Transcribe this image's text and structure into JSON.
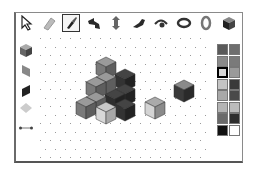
{
  "toolbar": {
    "tools": [
      {
        "name": "pointer",
        "icon": "pointer-arrow-icon",
        "x": 18,
        "selected": false
      },
      {
        "name": "eraser",
        "icon": "eraser-icon",
        "x": 40,
        "selected": false
      },
      {
        "name": "paint",
        "icon": "paint-brush-icon",
        "x": 62,
        "selected": true
      },
      {
        "name": "rotate-horizontal",
        "icon": "rotate-arrow-icon",
        "x": 85,
        "selected": false
      },
      {
        "name": "rotate-vertical",
        "icon": "vertical-arrow-icon",
        "x": 107,
        "selected": false
      },
      {
        "name": "rotate-curve",
        "icon": "curved-arrow-icon",
        "x": 130,
        "selected": false
      },
      {
        "name": "view",
        "icon": "eye-icon",
        "x": 152,
        "selected": false
      },
      {
        "name": "orbit-horizontal",
        "icon": "ring-horizontal-icon",
        "x": 175,
        "selected": false
      },
      {
        "name": "orbit-vertical",
        "icon": "ring-vertical-icon",
        "x": 197,
        "selected": false
      },
      {
        "name": "cube-view",
        "icon": "cube-icon",
        "x": 220,
        "selected": false
      }
    ]
  },
  "side_tools": [
    {
      "name": "cube",
      "icon": "cube-shape-icon",
      "y": 42
    },
    {
      "name": "left-face",
      "icon": "left-face-icon",
      "y": 62
    },
    {
      "name": "right-face",
      "icon": "right-face-icon",
      "y": 82
    },
    {
      "name": "top-face",
      "icon": "top-face-diamond-icon",
      "y": 100
    },
    {
      "name": "line",
      "icon": "line-segment-icon",
      "y": 120
    }
  ],
  "palette": {
    "selected_index": 4,
    "colors": [
      "#5a5a5a",
      "#6e6e6e",
      "#8a8a8a",
      "#7a7a7a",
      "#d8d8d8",
      "#9a9a9a",
      "#c4c4c4",
      "#3a3a3a",
      "#a8a8a8",
      "#4a4a4a",
      "#b4b4b4",
      "#bcbcbc",
      "#6a6a6a",
      "#2e2e2e",
      "#111111",
      "#ffffff"
    ]
  }
}
